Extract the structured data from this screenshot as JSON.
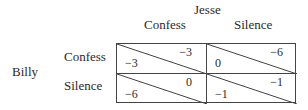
{
  "game": {
    "column_player": "Jesse",
    "row_player": "Billy",
    "column_strategies": [
      "Confess",
      "Silence"
    ],
    "row_strategies": [
      "Confess",
      "Silence"
    ],
    "payoffs": [
      [
        {
          "billy": "−3",
          "jesse": "−3"
        },
        {
          "billy": "0",
          "jesse": "−6"
        }
      ],
      [
        {
          "billy": "−6",
          "jesse": "0"
        },
        {
          "billy": "−1",
          "jesse": "−1"
        }
      ]
    ]
  },
  "colors": {
    "line": "#444444",
    "text": "#2a2a2a",
    "background": "#ffffff"
  }
}
